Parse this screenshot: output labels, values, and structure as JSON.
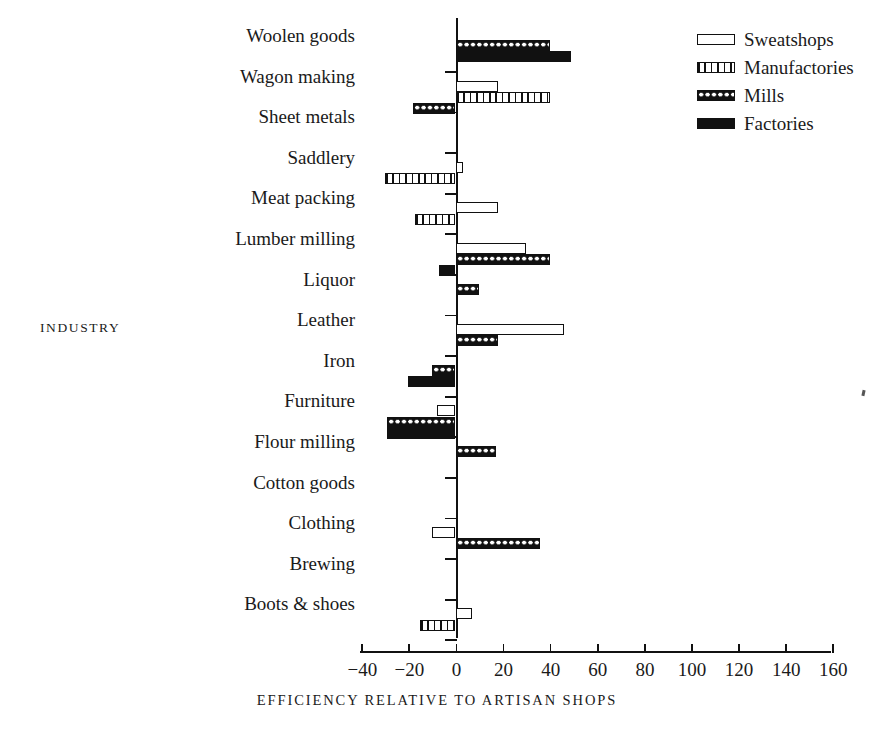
{
  "axis_title_y": "INDUSTRY",
  "axis_title_x": "EFFICIENCY RELATIVE TO ARTISAN SHOPS",
  "legend": {
    "items": [
      {
        "label": "Sweatshops",
        "pattern": "hollow",
        "color": "#ffffff"
      },
      {
        "label": "Manufactories",
        "pattern": "vertical-stripes",
        "color": "#111111"
      },
      {
        "label": "Mills",
        "pattern": "crosshatch-dots",
        "color": "#111111"
      },
      {
        "label": "Factories",
        "pattern": "solid",
        "color": "#111111"
      }
    ]
  },
  "chart_data": {
    "type": "bar",
    "orientation": "horizontal",
    "title": "",
    "xlabel": "EFFICIENCY RELATIVE TO ARTISAN SHOPS",
    "ylabel": "INDUSTRY",
    "xlim": [
      -40,
      160
    ],
    "xticks": [
      -40,
      -20,
      0,
      20,
      40,
      60,
      80,
      100,
      120,
      140,
      160
    ],
    "xticklabels": [
      "−40",
      "−20",
      "0",
      "20",
      "40",
      "60",
      "80",
      "100",
      "120",
      "140",
      "160"
    ],
    "grid": false,
    "legend_position": "top-right",
    "categories": [
      "Woolen goods",
      "Wagon making",
      "Sheet metals",
      "Saddlery",
      "Meat packing",
      "Lumber milling",
      "Liquor",
      "Leather",
      "Iron",
      "Furniture",
      "Flour milling",
      "Cotton goods",
      "Clothing",
      "Brewing",
      "Boots & shoes"
    ],
    "series": [
      {
        "name": "Sweatshops",
        "pattern": "hollow",
        "values": [
          null,
          18,
          null,
          3,
          18,
          30,
          null,
          46,
          null,
          -8,
          null,
          null,
          -10,
          null,
          7
        ]
      },
      {
        "name": "Manufactories",
        "pattern": "vertical-stripes",
        "values": [
          null,
          40,
          null,
          -30,
          -17,
          null,
          null,
          null,
          null,
          null,
          null,
          null,
          null,
          null,
          -15
        ]
      },
      {
        "name": "Mills",
        "pattern": "crosshatch-dots",
        "values": [
          40,
          -18,
          null,
          null,
          null,
          40,
          10,
          18,
          -10,
          -29,
          17,
          null,
          36,
          null,
          null
        ]
      },
      {
        "name": "Factories",
        "pattern": "solid",
        "values": [
          49,
          null,
          null,
          null,
          null,
          -7,
          null,
          null,
          -20,
          -29,
          null,
          null,
          null,
          null,
          null
        ]
      }
    ]
  }
}
